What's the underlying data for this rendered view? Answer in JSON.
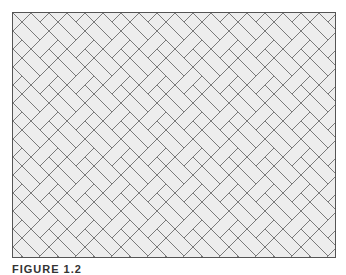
{
  "figure": {
    "pattern": "herringbone-brick",
    "brick_fill": "#efefef",
    "mortar_color": "#7a7a7a",
    "border_color": "#555555",
    "caption": "FIGURE 1.2"
  }
}
